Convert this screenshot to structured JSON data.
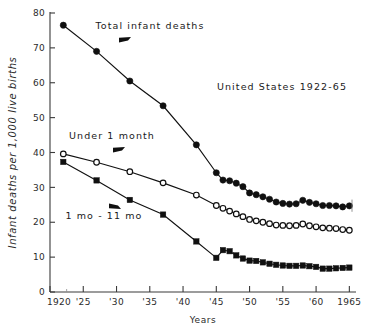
{
  "chart_data": {
    "type": "line",
    "title": "United States 1922-65",
    "xlabel": "Years",
    "ylabel": "Infant deaths per 1,000 live births",
    "xlim": [
      1920,
      1966
    ],
    "ylim": [
      0,
      80
    ],
    "grid": false,
    "legend_position": "inline-annotations",
    "xticks": [
      1920,
      1925,
      1930,
      1935,
      1940,
      1945,
      1950,
      1955,
      1960,
      1965
    ],
    "xticklabels": [
      "1920",
      "'25",
      "'30",
      "'35",
      "'40",
      "'45",
      "'50",
      "'55",
      "'60",
      "1965"
    ],
    "yticks": [
      0,
      10,
      20,
      30,
      40,
      50,
      60,
      70,
      80
    ],
    "yticklabels": [
      "0",
      "10",
      "20",
      "30",
      "40",
      "50",
      "60",
      "70",
      "80"
    ],
    "annotations": [
      {
        "text": "Total infant deaths",
        "marker": "arrow-left-down"
      },
      {
        "text": "Under 1 month",
        "marker": "arrow-left-down"
      },
      {
        "text": "1 mo - 11 mo",
        "marker": "arrow-left-up"
      }
    ],
    "series": [
      {
        "name": "Total infant deaths",
        "marker": "filled-circle",
        "x": [
          1922,
          1927,
          1932,
          1937,
          1942,
          1945,
          1946,
          1947,
          1948,
          1949,
          1950,
          1951,
          1952,
          1953,
          1954,
          1955,
          1956,
          1957,
          1958,
          1959,
          1960,
          1961,
          1962,
          1963,
          1964,
          1965
        ],
        "values": [
          76.5,
          69.0,
          60.5,
          53.4,
          42.2,
          34.2,
          32.1,
          31.9,
          31.2,
          30.2,
          28.4,
          27.9,
          27.3,
          26.6,
          25.8,
          25.4,
          25.2,
          25.3,
          26.3,
          25.7,
          25.3,
          24.8,
          24.8,
          24.7,
          24.4,
          24.7
        ]
      },
      {
        "name": "Under 1 month",
        "marker": "open-circle",
        "x": [
          1922,
          1927,
          1932,
          1937,
          1942,
          1945,
          1946,
          1947,
          1948,
          1949,
          1950,
          1951,
          1952,
          1953,
          1954,
          1955,
          1956,
          1957,
          1958,
          1959,
          1960,
          1961,
          1962,
          1963,
          1964,
          1965
        ],
        "values": [
          39.6,
          37.2,
          34.5,
          31.3,
          27.8,
          24.8,
          24.0,
          23.2,
          22.4,
          21.6,
          20.8,
          20.4,
          20.0,
          19.6,
          19.2,
          19.1,
          19.0,
          19.1,
          19.5,
          19.0,
          18.7,
          18.4,
          18.3,
          18.2,
          17.9,
          17.7
        ]
      },
      {
        "name": "1 mo - 11 mo",
        "marker": "filled-square",
        "x": [
          1922,
          1927,
          1932,
          1937,
          1942,
          1945,
          1946,
          1947,
          1948,
          1949,
          1950,
          1951,
          1952,
          1953,
          1954,
          1955,
          1956,
          1957,
          1958,
          1959,
          1960,
          1961,
          1962,
          1963,
          1964,
          1965
        ],
        "values": [
          37.3,
          32.0,
          26.4,
          22.2,
          14.5,
          9.8,
          12.0,
          11.7,
          10.5,
          9.6,
          9.0,
          8.9,
          8.5,
          8.1,
          7.8,
          7.6,
          7.5,
          7.5,
          7.6,
          7.4,
          7.2,
          6.7,
          6.7,
          6.8,
          6.9,
          7.0
        ]
      }
    ]
  },
  "caption": ""
}
